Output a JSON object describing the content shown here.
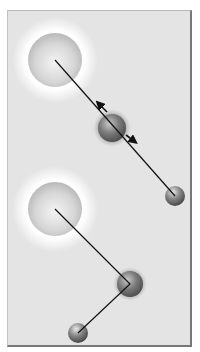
{
  "figure": {
    "panel_background": "#e4e4e4",
    "configurations": [
      {
        "name": "top",
        "large_atom": {
          "cx": 55,
          "cy": 60,
          "r": 27,
          "halo_r": 42
        },
        "medium_atom": {
          "cx": 112,
          "cy": 128,
          "r": 15,
          "vibration_arrows": true
        },
        "small_atom": {
          "cx": 175,
          "cy": 196,
          "r": 10
        },
        "bond_path": [
          [
            55,
            60
          ],
          [
            175,
            196
          ]
        ]
      },
      {
        "name": "bottom",
        "large_atom": {
          "cx": 55,
          "cy": 209,
          "r": 27,
          "halo_r": 42
        },
        "medium_atom": {
          "cx": 130,
          "cy": 284,
          "r": 15,
          "vibration_arrows": false
        },
        "small_atom": {
          "cx": 78,
          "cy": 333,
          "r": 10
        },
        "bond_path": [
          [
            55,
            209
          ],
          [
            130,
            284
          ],
          [
            78,
            333
          ]
        ]
      }
    ]
  }
}
